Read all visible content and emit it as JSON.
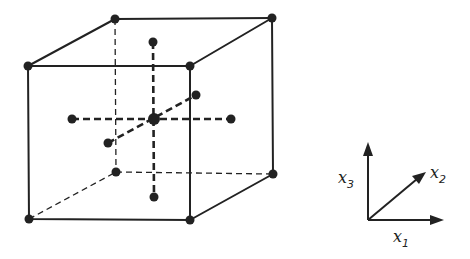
{
  "diagram": {
    "title": "",
    "colors": {
      "ink": "#222222",
      "background": "#ffffff"
    },
    "cube": {
      "vertices": {
        "front_top_left": [
          28,
          66
        ],
        "front_top_right": [
          190,
          66
        ],
        "front_bottom_left": [
          29,
          219
        ],
        "front_bottom_right": [
          190,
          220
        ],
        "back_top_left": [
          115,
          19
        ],
        "back_top_right": [
          272,
          18
        ],
        "back_bottom_left": [
          116,
          172
        ],
        "back_bottom_right": [
          273,
          174
        ]
      }
    },
    "center_atom": [
      154,
      119
    ],
    "neighbor_atoms": {
      "up": [
        153,
        42
      ],
      "down": [
        154,
        197
      ],
      "left": [
        72,
        119
      ],
      "right": [
        231,
        119
      ],
      "back": [
        196,
        95
      ],
      "front": [
        108,
        143
      ]
    },
    "axes": {
      "origin": [
        368,
        220
      ],
      "x1": {
        "tip": [
          443,
          221
        ],
        "label": "x",
        "subscript": "1"
      },
      "x2": {
        "tip": [
          425,
          173
        ],
        "label": "x",
        "subscript": "2"
      },
      "x3": {
        "tip": [
          367,
          143
        ],
        "label": "x",
        "subscript": "3"
      }
    }
  }
}
